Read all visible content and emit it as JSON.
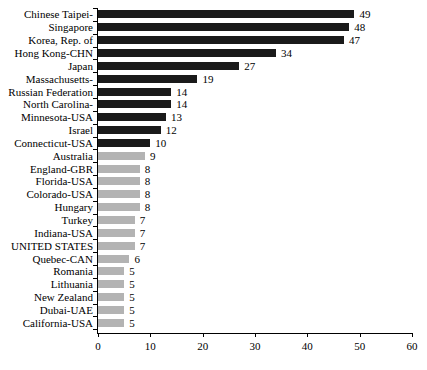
{
  "chart_data": {
    "type": "bar",
    "orientation": "horizontal",
    "title": "",
    "subtitle": "",
    "xlabel": "",
    "ylabel": "",
    "xlim": [
      0,
      60
    ],
    "xticks": [
      0,
      10,
      20,
      30,
      40,
      50,
      60
    ],
    "grid": false,
    "legend": null,
    "categories": [
      "Chinese Taipei-",
      "Singapore",
      "Korea, Rep. of",
      "Hong Kong-CHN",
      "Japan",
      "Massachusetts-",
      "Russian Federation",
      "North Carolina-",
      "Minnesota-USA",
      "Israel",
      "Connecticut-USA",
      "Australia",
      "England-GBR",
      "Florida-USA",
      "Colorado-USA",
      "Hungary",
      "Turkey",
      "Indiana-USA",
      "UNITED STATES",
      "Quebec-CAN",
      "Romania",
      "Lithuania",
      "New Zealand",
      "Dubai-UAE",
      "California-USA"
    ],
    "values": [
      49,
      48,
      47,
      34,
      27,
      19,
      14,
      14,
      13,
      12,
      10,
      9,
      8,
      8,
      8,
      8,
      7,
      7,
      7,
      6,
      5,
      5,
      5,
      5,
      5
    ],
    "bar_colors": [
      "dark",
      "dark",
      "dark",
      "dark",
      "dark",
      "dark",
      "dark",
      "dark",
      "dark",
      "dark",
      "dark",
      "light",
      "light",
      "light",
      "light",
      "light",
      "light",
      "light",
      "light",
      "light",
      "light",
      "light",
      "light",
      "light",
      "light"
    ],
    "colors": {
      "dark": "#1a1a1a",
      "light": "#b3b3b3",
      "axis": "#000000",
      "text": "#000000",
      "background": "#ffffff"
    }
  }
}
